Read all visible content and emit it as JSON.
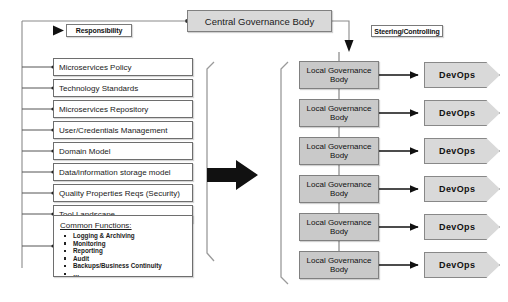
{
  "diagram": {
    "central": {
      "label": "Central Governance Body"
    },
    "captions": {
      "responsibility": "Responsibility",
      "steering": "Steering/Controlling"
    },
    "policies": [
      {
        "label": "Microservices Policy"
      },
      {
        "label": "Technology Standards"
      },
      {
        "label": "Microservices Repository"
      },
      {
        "label": "User/Credentials Management"
      },
      {
        "label": "Domain Model"
      },
      {
        "label": "Data/information storage model"
      },
      {
        "label": "Quality Properties Reqs (Security)"
      },
      {
        "label": "Tool Landscape"
      }
    ],
    "common_functions": {
      "title": "Common Functions:",
      "items": [
        "Logging & Archiving",
        "Monitoring",
        "Reporting",
        "Audit",
        "Backups/Business Continuity",
        "…"
      ]
    },
    "local_bodies": [
      {
        "label": "Local Governance Body"
      },
      {
        "label": "Local Governance Body"
      },
      {
        "label": "Local Governance Body"
      },
      {
        "label": "Local Governance Body"
      },
      {
        "label": "Local Governance Body"
      },
      {
        "label": "Local Governance Body"
      }
    ],
    "devops": [
      {
        "label": "DevOps"
      },
      {
        "label": "DevOps"
      },
      {
        "label": "DevOps"
      },
      {
        "label": "DevOps"
      },
      {
        "label": "DevOps"
      },
      {
        "label": "DevOps"
      }
    ],
    "colors": {
      "central_fill": "#d9d9d9",
      "local_fill": "#c9c9c9",
      "devops_fill": "#d9d9d9",
      "policy_fill": "#ffffff",
      "line": "#8a8a8a",
      "arrow_black": "#111111"
    }
  }
}
